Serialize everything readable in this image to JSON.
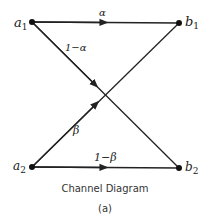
{
  "diagram": {
    "title": "Channel Diagram",
    "subtitle": "(a)",
    "nodes": [
      {
        "id": "a1",
        "label": "a",
        "sub": "1",
        "x": 32,
        "y": 22
      },
      {
        "id": "b1",
        "label": "b",
        "sub": "1",
        "x": 179,
        "y": 23
      },
      {
        "id": "a2",
        "label": "a",
        "sub": "2",
        "x": 32,
        "y": 167
      },
      {
        "id": "b2",
        "label": "b",
        "sub": "2",
        "x": 179,
        "y": 168
      }
    ],
    "edges": [
      {
        "from": "a1",
        "to": "b1",
        "label": "α"
      },
      {
        "from": "a1",
        "to": "b2",
        "label": "1−α"
      },
      {
        "from": "a2",
        "to": "b1",
        "label": "β"
      },
      {
        "from": "a2",
        "to": "b2",
        "label": "1−β"
      }
    ]
  }
}
